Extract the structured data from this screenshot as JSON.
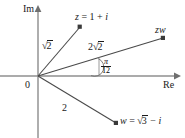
{
  "figure": {
    "kind": "argand-diagram",
    "background_color": "#ffffff",
    "stroke_color": "#3a3a3a",
    "text_color": "#1a1a1a"
  },
  "axes": {
    "imaginary_label": "Im",
    "real_label": "Re",
    "origin_label": "0"
  },
  "points": [
    {
      "name": "z",
      "label_parts": {
        "var": "z",
        "eq": " = 1 + ",
        "unit": "i"
      },
      "modulus_label": {
        "sign": "√",
        "radicand": "2",
        "coefficient": ""
      }
    },
    {
      "name": "zw",
      "label": "zw",
      "modulus_label": {
        "sign": "√",
        "radicand": "2",
        "coefficient": "2"
      }
    },
    {
      "name": "w",
      "label_parts": {
        "var": "w",
        "eq": " = ",
        "radical_sign": "√",
        "radicand": "3",
        "tail": " − ",
        "unit": "i"
      },
      "modulus_label": {
        "plain": "2"
      }
    }
  ],
  "angle": {
    "numerator": "π",
    "denominator": "12"
  }
}
